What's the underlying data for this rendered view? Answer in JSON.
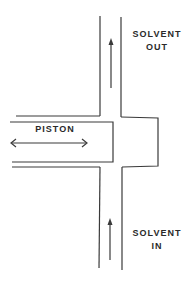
{
  "diagram": {
    "labels": {
      "solvent_out_line1": "SOLVENT",
      "solvent_out_line2": "OUT",
      "piston": "PISTON",
      "solvent_in_line1": "SOLVENT",
      "solvent_in_line2": "IN"
    },
    "colors": {
      "line": "#3a3a3a",
      "background": "#ffffff"
    }
  }
}
